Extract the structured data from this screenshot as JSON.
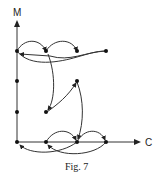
{
  "figure": {
    "caption": "Fig. 7",
    "axes": {
      "y_label": "M",
      "x_label": "C"
    },
    "colors": {
      "ink": "#222222",
      "background": "#ffffff"
    }
  },
  "diagram": {
    "type": "directed graph on M-C plane",
    "nodes": [
      {
        "id": "n1",
        "pos": "axis M, top level"
      },
      {
        "id": "n2",
        "pos": "top level, second"
      },
      {
        "id": "n3",
        "pos": "top level, third"
      },
      {
        "id": "n4",
        "pos": "top level, far right"
      },
      {
        "id": "n5",
        "pos": "axis M, middle-upper"
      },
      {
        "id": "n6",
        "pos": "middle, right"
      },
      {
        "id": "n7",
        "pos": "axis M, middle-lower"
      },
      {
        "id": "n8",
        "pos": "middle-lower, second"
      },
      {
        "id": "n9",
        "pos": "origin"
      },
      {
        "id": "n10",
        "pos": "axis C, second"
      },
      {
        "id": "n11",
        "pos": "axis C, third"
      },
      {
        "id": "n12",
        "pos": "axis C, fourth"
      }
    ],
    "edges": [
      {
        "from": "n1",
        "to": "n2"
      },
      {
        "from": "n2",
        "to": "n3"
      },
      {
        "from": "n1",
        "to": "n4"
      },
      {
        "from": "n3",
        "to": "n2"
      },
      {
        "from": "n2",
        "to": "n8"
      },
      {
        "from": "n8",
        "to": "n6"
      },
      {
        "from": "n6",
        "to": "n11"
      },
      {
        "from": "n10",
        "to": "n11"
      },
      {
        "from": "n11",
        "to": "n12"
      },
      {
        "from": "n12",
        "to": "n10"
      },
      {
        "from": "n11",
        "to": "n9"
      },
      {
        "from": "n1",
        "to": "n2"
      }
    ]
  }
}
